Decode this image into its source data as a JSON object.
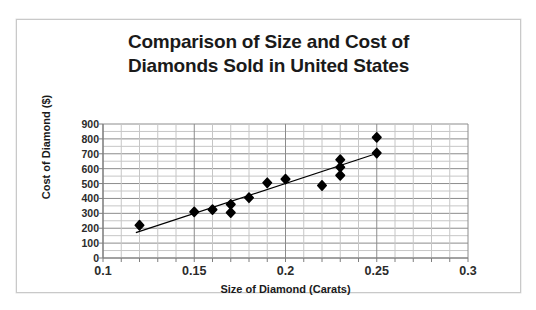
{
  "chart_data": {
    "type": "scatter",
    "title": "Comparison of Size and Cost of Diamonds Sold in United States",
    "title_line1": "Comparison of Size and Cost of",
    "title_line2": "Diamonds Sold in United States",
    "xlabel": "Size of Diamond (Carats)",
    "ylabel": "Cost of Diamond ($)",
    "xlim": [
      0.1,
      0.3
    ],
    "ylim": [
      0,
      900
    ],
    "xticks": [
      0.1,
      0.15,
      0.2,
      0.25,
      0.3
    ],
    "xtick_labels": [
      "0.1",
      "0.15",
      "0.2",
      "0.25",
      "0.3"
    ],
    "yticks": [
      0,
      100,
      200,
      300,
      400,
      500,
      600,
      700,
      800,
      900
    ],
    "ytick_labels": [
      "900",
      "800",
      "700",
      "600",
      "500",
      "400",
      "300",
      "200",
      "100",
      "0"
    ],
    "grid": true,
    "grid_minor_y": true,
    "grid_color": "#8c8c8c",
    "grid_minor_color": "#c6c6c6",
    "legend": false,
    "marker": "diamond",
    "marker_color": "#000000",
    "marker_size": 7,
    "points": [
      {
        "x": 0.12,
        "y": 220
      },
      {
        "x": 0.15,
        "y": 310
      },
      {
        "x": 0.16,
        "y": 325
      },
      {
        "x": 0.17,
        "y": 360
      },
      {
        "x": 0.17,
        "y": 305
      },
      {
        "x": 0.18,
        "y": 405
      },
      {
        "x": 0.19,
        "y": 505
      },
      {
        "x": 0.2,
        "y": 530
      },
      {
        "x": 0.22,
        "y": 487
      },
      {
        "x": 0.23,
        "y": 660
      },
      {
        "x": 0.23,
        "y": 610
      },
      {
        "x": 0.23,
        "y": 555
      },
      {
        "x": 0.25,
        "y": 810
      },
      {
        "x": 0.25,
        "y": 705
      }
    ],
    "trendline": {
      "type": "linear",
      "color": "#000000",
      "width": 1.2,
      "x_start": 0.118,
      "y_start": 170,
      "x_end": 0.252,
      "y_end": 710
    }
  }
}
